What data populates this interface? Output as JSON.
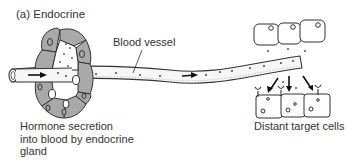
{
  "figure": {
    "panel_title": "(a)  Endocrine",
    "labels": {
      "blood_vessel": "Blood vessel",
      "gland_caption": [
        "Hormone secretion",
        "into blood by endocrine",
        "gland"
      ],
      "target_caption": "Distant target cells"
    },
    "colors": {
      "cell_fill": "#a9a9a9",
      "outline": "#333333",
      "vessel_fill": "#f6f6f6",
      "background": "#ffffff"
    }
  }
}
